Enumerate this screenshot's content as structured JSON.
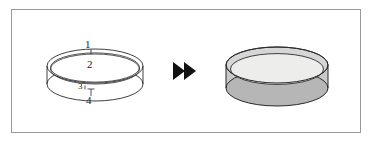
{
  "figure": {
    "type": "process-diagram",
    "frame": {
      "border_color": "#9a9a9a",
      "background_color": "#ffffff"
    },
    "colors": {
      "outline": "#1a1a1a",
      "arrow": "#111111",
      "dish_rim_shade": "#b4b4b4",
      "dish_wall_shade": "#d8d8d8",
      "dish_top_fill": "#ececeb",
      "frame_border": "#9a9a9a"
    },
    "left_object": {
      "name": "empty-dish",
      "style": "line-outline",
      "callouts": [
        {
          "id": "1",
          "label": "1",
          "target": "top-rim-edge"
        },
        {
          "id": "2",
          "label": "2",
          "target": "dish-interior"
        },
        {
          "id": "3",
          "label": "3",
          "target": "lower-rim-edge"
        },
        {
          "id": "4",
          "label": "4",
          "target": "dish-base"
        }
      ]
    },
    "arrow": {
      "name": "double-chevron-arrow",
      "glyph": "fast-forward",
      "direction": "right",
      "count": 2
    },
    "right_object": {
      "name": "filled-dish",
      "style": "shaded-filled",
      "callouts": []
    }
  }
}
